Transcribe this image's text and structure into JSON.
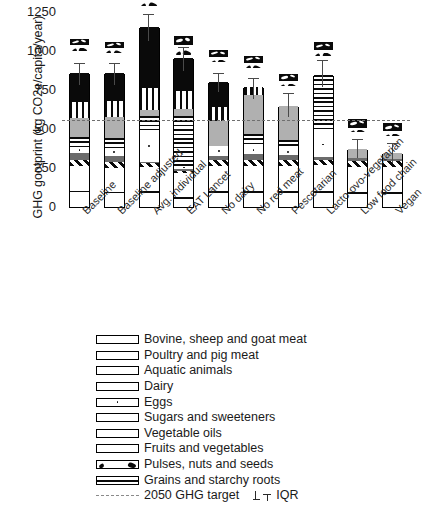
{
  "chart_data": {
    "type": "bar",
    "subtype": "stacked-bar-with-error-bars",
    "title": "",
    "xlabel": "",
    "ylabel": "GHG gootprint (kg CO2e/capita/year)",
    "ylim": [
      0,
      1250
    ],
    "yticks": [
      0,
      250,
      500,
      750,
      1000,
      1250
    ],
    "grid": false,
    "legend_position": "below-plot",
    "categories": [
      "Baseline",
      "Baseline adjusted",
      "Avg. individual",
      "EAT Lancet",
      "No dairy",
      "No red meat",
      "Pescetarian",
      "Lacto-ovo-vegetarian",
      "Low food chain",
      "Vegan"
    ],
    "series": [
      {
        "name": "Grains and starchy roots",
        "pattern": "grains",
        "values": [
          196,
          185,
          190,
          118,
          190,
          190,
          190,
          190,
          178,
          178
        ]
      },
      {
        "name": "Pulses, nuts and seeds",
        "pattern": "pulses",
        "values": [
          18,
          14,
          22,
          30,
          14,
          14,
          14,
          18,
          14,
          16
        ]
      },
      {
        "name": "Fruits and vegetables",
        "pattern": "fruits",
        "values": [
          34,
          38,
          30,
          58,
          42,
          44,
          46,
          44,
          50,
          48
        ]
      },
      {
        "name": "Vegetable oils",
        "pattern": "oils",
        "values": [
          36,
          34,
          22,
          14,
          38,
          38,
          36,
          30,
          34,
          34
        ]
      },
      {
        "name": "Sugars and sweeteners",
        "pattern": "sugars",
        "values": [
          42,
          36,
          10,
          8,
          22,
          34,
          30,
          20,
          22,
          16
        ]
      },
      {
        "name": "Eggs",
        "pattern": "eggs",
        "values": [
          34,
          46,
          190,
          22,
          64,
          46,
          34,
          150,
          0,
          0
        ]
      },
      {
        "name": "Dairy",
        "pattern": "dairy",
        "values": [
          60,
          66,
          86,
          302,
          0,
          74,
          54,
          346,
          0,
          0
        ]
      },
      {
        "name": "Aquatic animals",
        "pattern": "aquatic",
        "values": [
          118,
          124,
          36,
          40,
          148,
          238,
          208,
          0,
          52,
          32
        ]
      },
      {
        "name": "Poultry and pig meat",
        "pattern": "poultry",
        "values": [
          98,
          98,
          130,
          108,
          88,
          44,
          0,
          0,
          0,
          0
        ]
      },
      {
        "name": "Bovine, sheep and goat meat",
        "pattern": "bovine",
        "values": [
          176,
          170,
          374,
          198,
          148,
          0,
          0,
          0,
          0,
          0
        ]
      }
    ],
    "totals": [
      812,
      811,
      1090,
      898,
      754,
      722,
      612,
      798,
      350,
      324
    ],
    "error_bars_iqr": {
      "label": "IQR",
      "upper": [
        872,
        872,
        1168,
        968,
        808,
        778,
        688,
        890,
        412,
        388
      ],
      "lower": [
        742,
        742,
        1008,
        828,
        700,
        660,
        548,
        730,
        300,
        270
      ]
    },
    "reference_line": {
      "label": "2050 GHG target",
      "value": 525,
      "style": "dashed",
      "color": "#6f6f6f"
    },
    "legend_entries": [
      "Bovine, sheep and goat meat",
      "Poultry and pig meat",
      "Aquatic animals",
      "Dairy",
      "Eggs",
      "Sugars and sweeteners",
      "Vegetable oils",
      "Fruits and vegetables",
      "Pulses, nuts and seeds",
      "Grains and starchy roots",
      "2050 GHG target",
      "IQR"
    ]
  }
}
